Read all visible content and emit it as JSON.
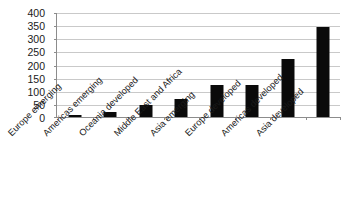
{
  "chart_data": {
    "type": "bar",
    "title": "",
    "subtitle": "",
    "xlabel": "",
    "ylabel": "",
    "categories": [
      "Europe emerging",
      "Americas emerging",
      "Oceania developed",
      "Middle East and Africa",
      "Asia emerging",
      "Europe developed",
      "Americas developed",
      "Asia developed"
    ],
    "values": [
      8,
      18,
      45,
      68,
      125,
      123,
      225,
      345
    ],
    "ylim": [
      0,
      400
    ],
    "ytick_labels": [
      "400",
      "350",
      "300",
      "250",
      "200",
      "150",
      "100",
      "50",
      "0"
    ],
    "yticks": [
      400,
      350,
      300,
      250,
      200,
      150,
      100,
      50,
      0
    ],
    "grid": true,
    "legend": "none",
    "bar_color": "#0a0a0a",
    "grid_color": "#c9c9c9",
    "axis_color": "#8c8c8c",
    "background_color": "#ffffff",
    "xtick_label_rotation": -45
  }
}
